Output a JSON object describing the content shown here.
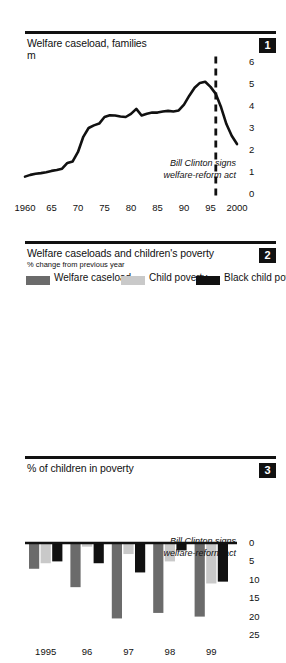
{
  "figure": {
    "panels": [
      {
        "number": "1",
        "title": "Welfare caseload, families",
        "unit": "m",
        "annotation_line1": "Bill Clinton signs",
        "annotation_line2": "welfare-reform act"
      },
      {
        "number": "2",
        "title": "Welfare caseloads and children's poverty",
        "subtitle": "% change from previous year"
      },
      {
        "number": "3",
        "title": "% of children in poverty",
        "annotation_line1": "Bill Clinton signs",
        "annotation_line2": "welfare-reform act"
      }
    ]
  },
  "colors": {
    "ink": "#111111",
    "welfare_caseload": "#6b6b6b",
    "child_poverty": "#c9c9c9",
    "black_child_poverty": "#111111",
    "background": "#ffffff"
  },
  "chart_data": [
    {
      "type": "line",
      "title": "Welfare caseload, families",
      "ylabel": "m",
      "xlabel": "",
      "ylim": [
        0,
        6
      ],
      "xlim": [
        1960,
        2000
      ],
      "yticks": [
        0,
        1,
        2,
        3,
        4,
        5,
        6
      ],
      "ytick_labels": [
        "0",
        "1",
        "2",
        "3",
        "4",
        "5",
        "6"
      ],
      "xticks": [
        1960,
        1965,
        1970,
        1975,
        1980,
        1985,
        1990,
        1995,
        2000
      ],
      "xtick_labels": [
        "1960",
        "65",
        "70",
        "75",
        "80",
        "85",
        "90",
        "95",
        "2000"
      ],
      "grid": false,
      "legend": "none",
      "annotations": [
        {
          "text": "Bill Clinton signs welfare-reform act",
          "x": 1996,
          "style": "dashed-vline"
        }
      ],
      "series": [
        {
          "name": "Welfare caseload (m families)",
          "x": [
            1960,
            1961,
            1962,
            1963,
            1964,
            1965,
            1966,
            1967,
            1968,
            1969,
            1970,
            1971,
            1972,
            1973,
            1974,
            1975,
            1976,
            1977,
            1978,
            1979,
            1980,
            1981,
            1982,
            1983,
            1984,
            1985,
            1986,
            1987,
            1988,
            1989,
            1990,
            1991,
            1992,
            1993,
            1994,
            1995,
            1996,
            1997,
            1998,
            1999,
            2000
          ],
          "values": [
            0.79,
            0.87,
            0.92,
            0.95,
            0.99,
            1.05,
            1.09,
            1.15,
            1.41,
            1.48,
            1.91,
            2.6,
            3.0,
            3.12,
            3.2,
            3.5,
            3.58,
            3.57,
            3.52,
            3.5,
            3.64,
            3.87,
            3.57,
            3.65,
            3.7,
            3.7,
            3.75,
            3.78,
            3.75,
            3.8,
            4.06,
            4.47,
            4.83,
            5.05,
            5.1,
            4.87,
            4.55,
            3.94,
            3.18,
            2.65,
            2.27
          ]
        }
      ]
    },
    {
      "type": "bar",
      "title": "Welfare caseloads and children's poverty",
      "subtitle": "% change from previous year",
      "xlabel": "",
      "ylabel": "",
      "ylim": [
        -25,
        0
      ],
      "yticks": [
        0,
        -5,
        -10,
        -15,
        -20,
        -25
      ],
      "ytick_labels": [
        "0",
        "5",
        "10",
        "15",
        "20",
        "25"
      ],
      "axis_note": "y values are negative (declines); tick labels shown unsigned",
      "grid": false,
      "legend": "top",
      "categories": [
        "1995",
        "96",
        "97",
        "98",
        "99"
      ],
      "series": [
        {
          "name": "Welfare caseload",
          "color": "#6b6b6b",
          "values": [
            -7.0,
            -12.0,
            -20.5,
            -19.0,
            -20.0
          ]
        },
        {
          "name": "Child poverty",
          "color": "#c9c9c9",
          "values": [
            -5.5,
            -1.0,
            -3.0,
            -5.0,
            -11.0
          ]
        },
        {
          "name": "Black child poverty",
          "color": "#111111",
          "values": [
            -5.0,
            -5.5,
            -8.0,
            -2.0,
            -10.5
          ]
        }
      ]
    },
    {
      "type": "line",
      "title": "% of children in poverty",
      "ylabel": "",
      "xlabel": "",
      "ylim": [
        0,
        30
      ],
      "xlim": [
        1960,
        1999
      ],
      "yticks": [
        0,
        5,
        10,
        15,
        20,
        25,
        30
      ],
      "ytick_labels": [
        "0",
        "5",
        "10",
        "15",
        "20",
        "25",
        "30"
      ],
      "xticks": [
        1960,
        1965,
        1970,
        1975,
        1980,
        1985,
        1990,
        1995,
        1999
      ],
      "xtick_labels": [
        "1960",
        "65",
        "70",
        "75",
        "80",
        "85",
        "90",
        "95",
        "99"
      ],
      "grid": false,
      "legend": "none",
      "annotations": [
        {
          "text": "Bill Clinton signs welfare-reform act",
          "x": 1996,
          "style": "dashed-vline"
        }
      ],
      "series": [
        {
          "name": "% of children in poverty",
          "x": [
            1960,
            1961,
            1962,
            1963,
            1964,
            1965,
            1966,
            1967,
            1968,
            1969,
            1970,
            1971,
            1972,
            1973,
            1974,
            1975,
            1976,
            1977,
            1978,
            1979,
            1980,
            1981,
            1982,
            1983,
            1984,
            1985,
            1986,
            1987,
            1988,
            1989,
            1990,
            1991,
            1992,
            1993,
            1994,
            1995,
            1996,
            1997,
            1998,
            1999
          ],
          "values": [
            24.3,
            24.8,
            24.0,
            23.3,
            23.0,
            22.7,
            21.0,
            20.5,
            18.5,
            17.0,
            15.5,
            15.0,
            14.2,
            14.2,
            15.0,
            16.2,
            15.2,
            15.5,
            15.4,
            16.0,
            17.9,
            19.5,
            21.3,
            21.8,
            21.0,
            20.5,
            20.1,
            20.0,
            19.2,
            19.0,
            20.1,
            21.1,
            21.6,
            21.9,
            20.8,
            20.2,
            19.8,
            19.2,
            18.3,
            16.9
          ]
        }
      ]
    }
  ]
}
